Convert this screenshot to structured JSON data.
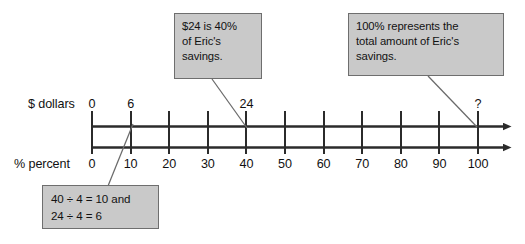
{
  "diagram": {
    "type": "double-number-line",
    "title_text": "",
    "axes": [
      {
        "id": "dollars",
        "name": "$ dollars",
        "position": "top",
        "labels": [
          {
            "value": 0,
            "text": "0",
            "percent_pos": 0
          },
          {
            "value": 6,
            "text": "6",
            "percent_pos": 10
          },
          {
            "value": 24,
            "text": "24",
            "percent_pos": 40
          },
          {
            "value": null,
            "text": "?",
            "percent_pos": 100
          }
        ]
      },
      {
        "id": "percent",
        "name": "% percent",
        "position": "bottom",
        "labels": [
          {
            "value": 0,
            "text": "0",
            "percent_pos": 0
          },
          {
            "value": 10,
            "text": "10",
            "percent_pos": 10
          },
          {
            "value": 20,
            "text": "20",
            "percent_pos": 20
          },
          {
            "value": 30,
            "text": "30",
            "percent_pos": 30
          },
          {
            "value": 40,
            "text": "40",
            "percent_pos": 40
          },
          {
            "value": 50,
            "text": "50",
            "percent_pos": 50
          },
          {
            "value": 60,
            "text": "60",
            "percent_pos": 60
          },
          {
            "value": 70,
            "text": "70",
            "percent_pos": 70
          },
          {
            "value": 80,
            "text": "80",
            "percent_pos": 80
          },
          {
            "value": 90,
            "text": "90",
            "percent_pos": 90
          },
          {
            "value": 100,
            "text": "100",
            "percent_pos": 100
          }
        ]
      }
    ],
    "callouts": [
      {
        "id": "callout-24",
        "text": "$24 is 40%\nof Eric's\nsavings.",
        "points_to_percent": 40
      },
      {
        "id": "callout-100",
        "text": "100% represents the\ntotal amount of Eric's\nsavings.",
        "points_to_percent": 100
      },
      {
        "id": "callout-div",
        "text": "40 ÷ 4 = 10 and\n24 ÷ 4 = 6",
        "points_to_percent": 10
      }
    ]
  },
  "colors": {
    "callout_fill": "#c9c9c9",
    "callout_border": "#6e6e6e",
    "line": "#2b2b2b",
    "leader": "#5a5a5a",
    "text": "#121212",
    "background": "#ffffff"
  }
}
